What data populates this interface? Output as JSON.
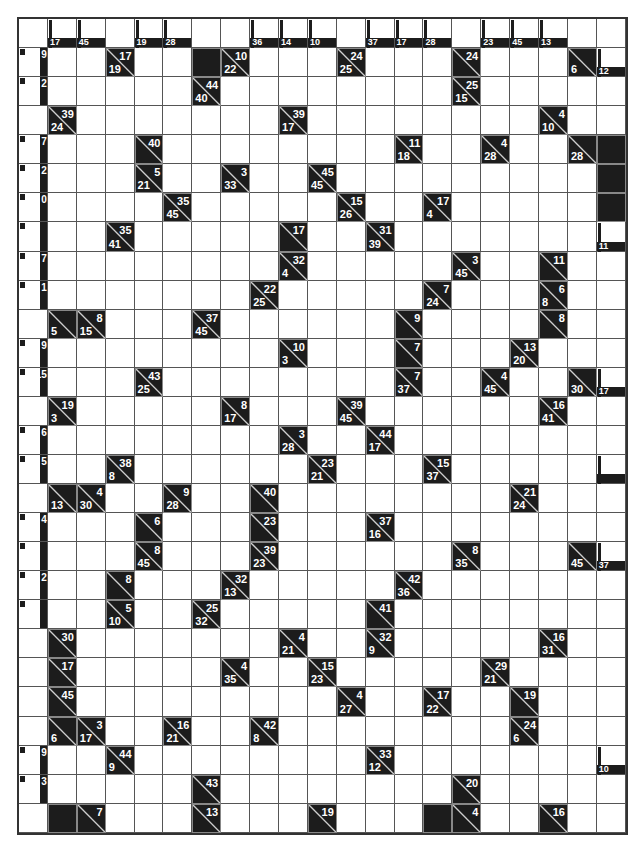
{
  "puzzle": {
    "type": "kakuro",
    "rows": 28,
    "cols": 21,
    "colors": {
      "clue_bg": "#1c1c1c",
      "white": "#ffffff",
      "grid_line": "#555555",
      "clue_text": "#ffffff"
    },
    "legend": "clue cells: d = down sum (bottom-left), a = across sum (top-right); '.' = empty entry cell; '#' = solid block; 'p' = clipped edge clue",
    "grid": [
      [
        {
          "t": "blank"
        },
        {
          "t": "p",
          "d": "17"
        },
        {
          "t": "p",
          "d": "45"
        },
        {
          "t": "blank"
        },
        {
          "t": "p",
          "d": "19"
        },
        {
          "t": "p",
          "d": "28"
        },
        {
          "t": "blank"
        },
        {
          "t": "blank"
        },
        {
          "t": "p",
          "d": "36"
        },
        {
          "t": "p",
          "d": "14"
        },
        {
          "t": "p",
          "d": "10"
        },
        {
          "t": "blank"
        },
        {
          "t": "p",
          "d": "37"
        },
        {
          "t": "p",
          "d": "17"
        },
        {
          "t": "p",
          "d": "28"
        },
        {
          "t": "blank"
        },
        {
          "t": "p",
          "d": "23"
        },
        {
          "t": "p",
          "d": "45"
        },
        {
          "t": "p",
          "d": "13"
        },
        {
          "t": "blank"
        },
        {
          "t": "blank"
        }
      ],
      [
        {
          "t": "p",
          "a": "9"
        },
        ".",
        ".",
        {
          "t": "c",
          "d": "19",
          "a": "17"
        },
        ".",
        ".",
        "#",
        {
          "t": "c",
          "d": "22",
          "a": "10"
        },
        ".",
        ".",
        ".",
        {
          "t": "c",
          "d": "25",
          "a": "24"
        },
        ".",
        ".",
        ".",
        {
          "t": "c",
          "a": "24"
        },
        ".",
        ".",
        ".",
        {
          "t": "c",
          "d": "6"
        },
        {
          "t": "p",
          "d": "12"
        }
      ],
      [
        {
          "t": "p",
          "a": "2"
        },
        ".",
        ".",
        ".",
        ".",
        ".",
        {
          "t": "c",
          "d": "40",
          "a": "44"
        },
        ".",
        ".",
        ".",
        ".",
        ".",
        ".",
        ".",
        ".",
        {
          "t": "c",
          "d": "15",
          "a": "25"
        },
        ".",
        ".",
        ".",
        ".",
        "."
      ],
      [
        {
          "t": "blank"
        },
        {
          "t": "c",
          "d": "24",
          "a": "39"
        },
        ".",
        ".",
        ".",
        ".",
        ".",
        ".",
        ".",
        {
          "t": "c",
          "d": "17",
          "a": "39"
        },
        ".",
        ".",
        ".",
        ".",
        ".",
        ".",
        ".",
        ".",
        {
          "t": "c",
          "d": "10",
          "a": "4"
        },
        ".",
        "."
      ],
      [
        {
          "t": "p",
          "a": "7"
        },
        ".",
        ".",
        ".",
        {
          "t": "c",
          "a": "40"
        },
        ".",
        ".",
        ".",
        ".",
        ".",
        ".",
        ".",
        ".",
        {
          "t": "c",
          "d": "18",
          "a": "11"
        },
        ".",
        ".",
        {
          "t": "c",
          "d": "28",
          "a": "4"
        },
        ".",
        ".",
        {
          "t": "c",
          "d": "28"
        },
        "#"
      ],
      [
        {
          "t": "p",
          "a": "2"
        },
        ".",
        ".",
        ".",
        {
          "t": "c",
          "d": "21",
          "a": "5"
        },
        ".",
        ".",
        {
          "t": "c",
          "d": "33",
          "a": "3"
        },
        ".",
        ".",
        {
          "t": "c",
          "d": "45",
          "a": "45"
        },
        ".",
        ".",
        ".",
        ".",
        ".",
        ".",
        ".",
        ".",
        ".",
        "#"
      ],
      [
        {
          "t": "p",
          "a": "0"
        },
        ".",
        ".",
        ".",
        ".",
        {
          "t": "c",
          "d": "45",
          "a": "35"
        },
        ".",
        ".",
        ".",
        ".",
        ".",
        {
          "t": "c",
          "d": "26",
          "a": "15"
        },
        ".",
        ".",
        {
          "t": "c",
          "d": "4",
          "a": "17"
        },
        ".",
        ".",
        ".",
        ".",
        ".",
        "#"
      ],
      [
        {
          "t": "p",
          "a": ""
        },
        ".",
        ".",
        {
          "t": "c",
          "d": "41",
          "a": "35"
        },
        ".",
        ".",
        ".",
        ".",
        ".",
        {
          "t": "c",
          "a": "17"
        },
        ".",
        ".",
        {
          "t": "c",
          "d": "39",
          "a": "31"
        },
        ".",
        ".",
        ".",
        ".",
        ".",
        ".",
        ".",
        {
          "t": "p",
          "d": "11"
        }
      ],
      [
        {
          "t": "p",
          "a": "7"
        },
        ".",
        ".",
        ".",
        ".",
        ".",
        ".",
        ".",
        ".",
        {
          "t": "c",
          "d": "4",
          "a": "32"
        },
        ".",
        ".",
        ".",
        ".",
        ".",
        {
          "t": "c",
          "d": "45",
          "a": "3"
        },
        ".",
        ".",
        {
          "t": "c",
          "a": "11"
        },
        ".",
        "."
      ],
      [
        {
          "t": "p",
          "a": "1"
        },
        ".",
        ".",
        ".",
        ".",
        ".",
        ".",
        ".",
        {
          "t": "c",
          "d": "25",
          "a": "22"
        },
        ".",
        ".",
        ".",
        ".",
        ".",
        {
          "t": "c",
          "d": "24",
          "a": "7"
        },
        ".",
        ".",
        ".",
        {
          "t": "c",
          "d": "8",
          "a": "6"
        },
        ".",
        "."
      ],
      [
        {
          "t": "blank"
        },
        {
          "t": "c",
          "d": "5"
        },
        {
          "t": "c",
          "d": "15",
          "a": "8"
        },
        ".",
        ".",
        ".",
        {
          "t": "c",
          "d": "45",
          "a": "37"
        },
        ".",
        ".",
        ".",
        ".",
        ".",
        ".",
        {
          "t": "c",
          "a": "9"
        },
        ".",
        ".",
        ".",
        ".",
        {
          "t": "c",
          "a": "8"
        },
        ".",
        "."
      ],
      [
        {
          "t": "p",
          "a": "9"
        },
        ".",
        ".",
        ".",
        ".",
        ".",
        ".",
        ".",
        ".",
        {
          "t": "c",
          "d": "3",
          "a": "10"
        },
        ".",
        ".",
        ".",
        {
          "t": "c",
          "a": "7"
        },
        ".",
        ".",
        ".",
        {
          "t": "c",
          "d": "20",
          "a": "13"
        },
        ".",
        ".",
        "."
      ],
      [
        {
          "t": "p",
          "a": "15"
        },
        ".",
        ".",
        ".",
        {
          "t": "c",
          "d": "25",
          "a": "43"
        },
        ".",
        ".",
        ".",
        ".",
        ".",
        ".",
        ".",
        ".",
        {
          "t": "c",
          "d": "37",
          "a": "7"
        },
        ".",
        ".",
        {
          "t": "c",
          "d": "45",
          "a": "4"
        },
        ".",
        ".",
        {
          "t": "c",
          "d": "30"
        },
        {
          "t": "p",
          "d": "17"
        }
      ],
      [
        {
          "t": "blank"
        },
        {
          "t": "c",
          "d": "3",
          "a": "19"
        },
        ".",
        ".",
        ".",
        ".",
        ".",
        {
          "t": "c",
          "d": "17",
          "a": "8"
        },
        ".",
        ".",
        ".",
        {
          "t": "c",
          "d": "45",
          "a": "39"
        },
        ".",
        ".",
        ".",
        ".",
        ".",
        ".",
        {
          "t": "c",
          "d": "41",
          "a": "16"
        },
        ".",
        "."
      ],
      [
        {
          "t": "p",
          "a": "6"
        },
        ".",
        ".",
        ".",
        ".",
        ".",
        ".",
        ".",
        ".",
        {
          "t": "c",
          "d": "28",
          "a": "3"
        },
        ".",
        ".",
        {
          "t": "c",
          "d": "17",
          "a": "44"
        },
        ".",
        ".",
        ".",
        ".",
        ".",
        ".",
        ".",
        "."
      ],
      [
        {
          "t": "p",
          "a": "5"
        },
        ".",
        ".",
        {
          "t": "c",
          "d": "8",
          "a": "38"
        },
        ".",
        ".",
        ".",
        ".",
        ".",
        ".",
        {
          "t": "c",
          "d": "21",
          "a": "23"
        },
        ".",
        ".",
        ".",
        {
          "t": "c",
          "d": "37",
          "a": "15"
        },
        ".",
        ".",
        ".",
        ".",
        ".",
        {
          "t": "p",
          "d": ""
        }
      ],
      [
        {
          "t": "blank"
        },
        {
          "t": "c",
          "d": "13"
        },
        {
          "t": "c",
          "d": "30",
          "a": "4"
        },
        ".",
        ".",
        {
          "t": "c",
          "d": "28",
          "a": "9"
        },
        ".",
        ".",
        {
          "t": "c",
          "a": "40"
        },
        ".",
        ".",
        ".",
        ".",
        ".",
        ".",
        ".",
        ".",
        {
          "t": "c",
          "d": "24",
          "a": "21"
        },
        ".",
        ".",
        "."
      ],
      [
        {
          "t": "p",
          "a": "4"
        },
        ".",
        ".",
        ".",
        {
          "t": "c",
          "a": "6"
        },
        ".",
        ".",
        ".",
        {
          "t": "c",
          "a": "23"
        },
        ".",
        ".",
        ".",
        {
          "t": "c",
          "d": "16",
          "a": "37"
        },
        ".",
        ".",
        ".",
        ".",
        ".",
        ".",
        ".",
        "."
      ],
      [
        {
          "t": "p",
          "a": ""
        },
        ".",
        ".",
        ".",
        {
          "t": "c",
          "d": "45",
          "a": "8"
        },
        ".",
        ".",
        ".",
        {
          "t": "c",
          "d": "23",
          "a": "39"
        },
        ".",
        ".",
        ".",
        ".",
        ".",
        ".",
        {
          "t": "c",
          "d": "35",
          "a": "8"
        },
        ".",
        ".",
        ".",
        {
          "t": "c",
          "d": "45"
        },
        {
          "t": "p",
          "d": "37"
        }
      ],
      [
        {
          "t": "p",
          "a": "2"
        },
        ".",
        ".",
        {
          "t": "c",
          "a": "8"
        },
        ".",
        ".",
        ".",
        {
          "t": "c",
          "d": "13",
          "a": "32"
        },
        ".",
        ".",
        ".",
        ".",
        ".",
        {
          "t": "c",
          "d": "36",
          "a": "42"
        },
        ".",
        ".",
        ".",
        ".",
        ".",
        ".",
        "."
      ],
      [
        {
          "t": "p",
          "a": ""
        },
        ".",
        ".",
        {
          "t": "c",
          "d": "10",
          "a": "5"
        },
        ".",
        ".",
        {
          "t": "c",
          "d": "32",
          "a": "25"
        },
        ".",
        ".",
        ".",
        ".",
        ".",
        {
          "t": "c",
          "a": "41"
        },
        ".",
        ".",
        ".",
        ".",
        ".",
        ".",
        ".",
        "."
      ],
      [
        {
          "t": "blank"
        },
        {
          "t": "c",
          "a": "30"
        },
        ".",
        ".",
        ".",
        ".",
        ".",
        ".",
        ".",
        {
          "t": "c",
          "d": "21",
          "a": "4"
        },
        ".",
        ".",
        {
          "t": "c",
          "d": "9",
          "a": "32"
        },
        ".",
        ".",
        ".",
        ".",
        ".",
        {
          "t": "c",
          "d": "31",
          "a": "16"
        },
        ".",
        "."
      ],
      [
        {
          "t": "blank"
        },
        {
          "t": "c",
          "a": "17"
        },
        ".",
        ".",
        ".",
        ".",
        ".",
        {
          "t": "c",
          "d": "35",
          "a": "4"
        },
        ".",
        ".",
        {
          "t": "c",
          "d": "23",
          "a": "15"
        },
        ".",
        ".",
        ".",
        ".",
        ".",
        {
          "t": "c",
          "d": "21",
          "a": "29"
        },
        ".",
        ".",
        ".",
        "."
      ],
      [
        {
          "t": "blank"
        },
        {
          "t": "c",
          "a": "45"
        },
        ".",
        ".",
        ".",
        ".",
        ".",
        ".",
        ".",
        ".",
        ".",
        {
          "t": "c",
          "d": "27",
          "a": "4"
        },
        ".",
        ".",
        {
          "t": "c",
          "d": "22",
          "a": "17"
        },
        ".",
        ".",
        {
          "t": "c",
          "a": "19"
        },
        ".",
        ".",
        "."
      ],
      [
        {
          "t": "blank"
        },
        {
          "t": "c",
          "d": "6"
        },
        {
          "t": "c",
          "d": "17",
          "a": "3"
        },
        ".",
        ".",
        {
          "t": "c",
          "d": "21",
          "a": "16"
        },
        ".",
        ".",
        {
          "t": "c",
          "d": "8",
          "a": "42"
        },
        ".",
        ".",
        ".",
        ".",
        ".",
        ".",
        ".",
        ".",
        {
          "t": "c",
          "d": "6",
          "a": "24"
        },
        ".",
        ".",
        "."
      ],
      [
        {
          "t": "p",
          "a": "9"
        },
        ".",
        ".",
        {
          "t": "c",
          "d": "9",
          "a": "44"
        },
        ".",
        ".",
        ".",
        ".",
        ".",
        ".",
        ".",
        ".",
        {
          "t": "c",
          "d": "12",
          "a": "33"
        },
        ".",
        ".",
        ".",
        ".",
        ".",
        ".",
        ".",
        {
          "t": "p",
          "d": "10"
        }
      ],
      [
        {
          "t": "p",
          "a": "3"
        },
        ".",
        ".",
        ".",
        ".",
        ".",
        {
          "t": "c",
          "a": "43"
        },
        ".",
        ".",
        ".",
        ".",
        ".",
        ".",
        ".",
        ".",
        {
          "t": "c",
          "a": "20"
        },
        ".",
        ".",
        ".",
        ".",
        "."
      ],
      [
        {
          "t": "blank"
        },
        "#",
        {
          "t": "c",
          "a": "7"
        },
        ".",
        ".",
        ".",
        {
          "t": "c",
          "a": "13"
        },
        ".",
        ".",
        ".",
        {
          "t": "c",
          "a": "19"
        },
        ".",
        ".",
        ".",
        "#",
        {
          "t": "c",
          "a": "4"
        },
        ".",
        ".",
        {
          "t": "c",
          "a": "16"
        },
        ".",
        "."
      ]
    ]
  }
}
